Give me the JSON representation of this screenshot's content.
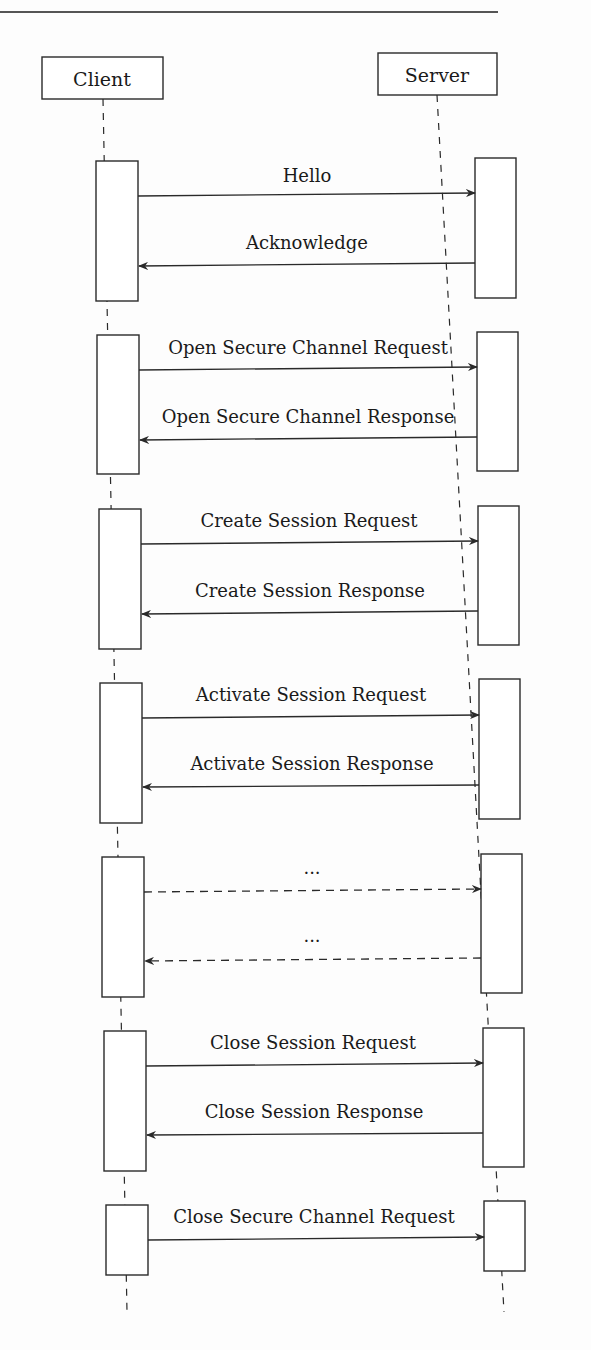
{
  "diagram": {
    "type": "sequence",
    "actors": [
      {
        "id": "client",
        "label": "Client"
      },
      {
        "id": "server",
        "label": "Server"
      }
    ],
    "phases": [
      {
        "messages": [
          {
            "label": "Hello",
            "from": "client",
            "to": "server",
            "style": "solid"
          },
          {
            "label": "Acknowledge",
            "from": "server",
            "to": "client",
            "style": "solid"
          }
        ]
      },
      {
        "messages": [
          {
            "label": "Open Secure Channel Request",
            "from": "client",
            "to": "server",
            "style": "solid"
          },
          {
            "label": "Open Secure Channel Response",
            "from": "server",
            "to": "client",
            "style": "solid"
          }
        ]
      },
      {
        "messages": [
          {
            "label": "Create Session Request",
            "from": "client",
            "to": "server",
            "style": "solid"
          },
          {
            "label": "Create Session Response",
            "from": "server",
            "to": "client",
            "style": "solid"
          }
        ]
      },
      {
        "messages": [
          {
            "label": "Activate Session Request",
            "from": "client",
            "to": "server",
            "style": "solid"
          },
          {
            "label": "Activate Session Response",
            "from": "server",
            "to": "client",
            "style": "solid"
          }
        ]
      },
      {
        "messages": [
          {
            "label": "...",
            "from": "client",
            "to": "server",
            "style": "dashed"
          },
          {
            "label": "...",
            "from": "server",
            "to": "client",
            "style": "dashed"
          }
        ]
      },
      {
        "messages": [
          {
            "label": "Close Session Request",
            "from": "client",
            "to": "server",
            "style": "solid"
          },
          {
            "label": "Close Session Response",
            "from": "server",
            "to": "client",
            "style": "solid"
          }
        ]
      },
      {
        "messages": [
          {
            "label": "Close Secure Channel Request",
            "from": "client",
            "to": "server",
            "style": "solid"
          }
        ]
      }
    ]
  },
  "colors": {
    "line": "#2a2a2a",
    "text": "#1a1a1a",
    "background": "#fdfdfd"
  }
}
